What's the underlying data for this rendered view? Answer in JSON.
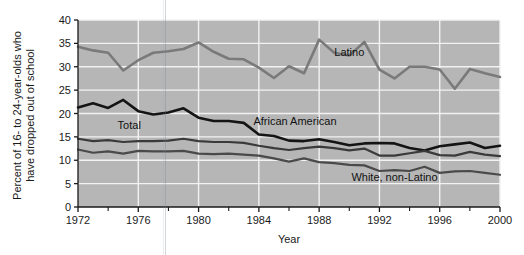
{
  "chart_data": {
    "type": "line",
    "title": "",
    "xlabel": "Year",
    "ylabel": "Percent of 16- to 24-year-olds who have dropped out of school",
    "ylabel_line1": "Percent of 16- to 24-year-olds who",
    "ylabel_line2": "have dropped out of school",
    "xlim": [
      1972,
      2000
    ],
    "ylim": [
      0,
      40
    ],
    "grid": true,
    "legend_position": "inline-annotations",
    "x": [
      1972,
      1973,
      1974,
      1975,
      1976,
      1977,
      1978,
      1979,
      1980,
      1981,
      1982,
      1983,
      1984,
      1985,
      1986,
      1987,
      1988,
      1989,
      1990,
      1991,
      1992,
      1993,
      1994,
      1995,
      1996,
      1997,
      1998,
      1999,
      2000
    ],
    "x_tick_labels": [
      "1972",
      "1976",
      "1980",
      "1984",
      "1988",
      "1992",
      "1996",
      "2000"
    ],
    "x_tick_values": [
      1972,
      1976,
      1980,
      1984,
      1988,
      1992,
      1996,
      2000
    ],
    "x_minor_tick_values": [
      1974,
      1978,
      1982,
      1986,
      1990,
      1994,
      1998
    ],
    "y_tick_labels": [
      "0",
      "5",
      "10",
      "15",
      "20",
      "25",
      "30",
      "35",
      "40"
    ],
    "y_tick_values": [
      0,
      5,
      10,
      15,
      20,
      25,
      30,
      35,
      40
    ],
    "series": [
      {
        "name": "Latino",
        "label": "Latino",
        "color": "#7a7a7a",
        "width": 2.6,
        "values": [
          34.3,
          33.5,
          33.0,
          29.2,
          31.4,
          33.0,
          33.3,
          33.8,
          35.2,
          33.2,
          31.7,
          31.6,
          29.8,
          27.6,
          30.1,
          28.6,
          35.8,
          33.0,
          32.4,
          35.3,
          29.4,
          27.5,
          30.0,
          30.0,
          29.4,
          25.3,
          29.5,
          28.6,
          27.8
        ]
      },
      {
        "name": "African American",
        "label": "African American",
        "color": "#141414",
        "width": 2.6,
        "values": [
          21.3,
          22.2,
          21.2,
          22.9,
          20.5,
          19.8,
          20.2,
          21.1,
          19.1,
          18.4,
          18.4,
          18.0,
          15.5,
          15.2,
          14.2,
          14.1,
          14.5,
          13.9,
          13.2,
          13.6,
          13.7,
          13.6,
          12.6,
          12.1,
          13.0,
          13.4,
          13.8,
          12.6,
          13.1
        ]
      },
      {
        "name": "Total",
        "label": "Total",
        "color": "#3a3a3a",
        "width": 2.2,
        "values": [
          14.6,
          14.1,
          14.3,
          13.9,
          14.1,
          14.1,
          14.2,
          14.6,
          14.1,
          13.9,
          13.9,
          13.7,
          13.1,
          12.6,
          12.2,
          12.6,
          12.9,
          12.6,
          12.1,
          12.5,
          11.0,
          11.0,
          11.5,
          12.0,
          11.1,
          11.0,
          11.8,
          11.2,
          10.9
        ]
      },
      {
        "name": "White, non-Latino",
        "label": "White, non-Latino",
        "color": "#4a4a4a",
        "width": 2.2,
        "values": [
          12.3,
          11.6,
          11.9,
          11.4,
          12.0,
          11.9,
          11.9,
          12.0,
          11.4,
          11.3,
          11.4,
          11.2,
          11.0,
          10.4,
          9.7,
          10.4,
          9.6,
          9.4,
          9.0,
          8.9,
          7.7,
          7.9,
          7.7,
          8.6,
          7.3,
          7.6,
          7.7,
          7.3,
          6.9
        ]
      }
    ],
    "annotations": [
      {
        "text": "Latino",
        "x": 1990.0,
        "y": 32.3,
        "name": "latino"
      },
      {
        "text": "African American",
        "x": 1986.4,
        "y": 17.6,
        "name": "african-american"
      },
      {
        "text": "Total",
        "x": 1975.4,
        "y": 16.7,
        "name": "total"
      },
      {
        "text": "White, non-Latino",
        "x": 1993.0,
        "y": 5.6,
        "name": "white-non-latino"
      }
    ],
    "colors": {
      "plot_background": "#b6b6b6",
      "gridline": "#f2f2f2",
      "axis": "#1a1a1a",
      "page_background": "#ffffff"
    }
  }
}
